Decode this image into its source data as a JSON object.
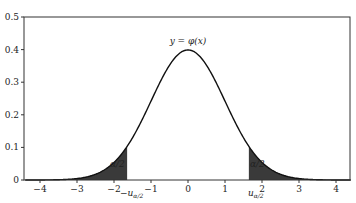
{
  "chart_data": {
    "type": "area",
    "title": "",
    "curve_label": "y = φ(x)",
    "function": "standard normal density φ(x) = exp(-x²/2)/√(2π)",
    "xlabel": "",
    "ylabel": "",
    "xlim": [
      -4.4,
      4.4
    ],
    "ylim": [
      0,
      0.5
    ],
    "x_ticks": [
      "-4",
      "-3",
      "-2",
      "-1",
      "0",
      "1",
      "2",
      "3",
      "4"
    ],
    "y_ticks": [
      "0",
      "0.1",
      "0.2",
      "0.3",
      "0.4",
      "0.5"
    ],
    "grid": false,
    "critical_value": 1.645,
    "critical_labels": {
      "left": "−u_{α/2}",
      "right": "u_{α/2}"
    },
    "shaded_regions": [
      {
        "from": -4.4,
        "to": -1.645,
        "label": "α/2"
      },
      {
        "from": 1.645,
        "to": 4.4,
        "label": "α/2"
      }
    ],
    "sample_points": {
      "x": [
        -4,
        -3,
        -2,
        -1.645,
        -1,
        0,
        1,
        1.645,
        2,
        3,
        4
      ],
      "y": [
        0.0001,
        0.0044,
        0.054,
        0.103,
        0.242,
        0.399,
        0.242,
        0.103,
        0.054,
        0.0044,
        0.0001
      ]
    },
    "colors": {
      "curve": "#111111",
      "fill": "#3a3a3a",
      "frame": "#333333"
    }
  },
  "labels": {
    "curve": "y = φ(x)",
    "tail_left": "α/2",
    "tail_right": "α/2",
    "crit_left_main": "−u",
    "crit_left_sub": "α/2",
    "crit_right_main": "u",
    "crit_right_sub": "α/2"
  }
}
